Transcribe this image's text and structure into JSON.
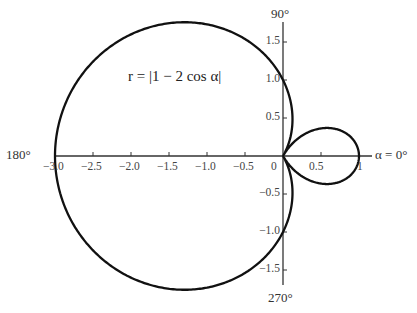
{
  "chart_data": {
    "type": "polar-line",
    "title": "",
    "equation": "r = |1 − 2 cos α|",
    "series": [
      {
        "name": "r = |1 − 2 cos α|",
        "function": "abs(1 - 2*cos(alpha))",
        "alpha_range_deg": [
          0,
          360
        ]
      }
    ],
    "angle_labels": {
      "a0": "α = 0°",
      "a90": "90°",
      "a180": "180°",
      "a270": "270°"
    },
    "x_ticks": [
      "−3.0",
      "−2.5",
      "−2.0",
      "−1.5",
      "−1.0",
      "−0.5",
      "0",
      "0.5",
      "1"
    ],
    "x_tick_values": [
      -3.0,
      -2.5,
      -2.0,
      -1.5,
      -1.0,
      -0.5,
      0,
      0.5,
      1
    ],
    "y_ticks_pos": [
      "0.5",
      "1.0",
      "1.5"
    ],
    "y_ticks_neg": [
      "−0.5",
      "−1.0",
      "−1.5"
    ],
    "y_tick_values": [
      -1.5,
      -1.0,
      -0.5,
      0.5,
      1.0,
      1.5
    ],
    "xlim": [
      -3.0,
      1.0
    ],
    "ylim": [
      -1.7,
      1.7
    ],
    "grid": false,
    "key_points": [
      {
        "alpha_deg": 0,
        "r": 1
      },
      {
        "alpha_deg": 60,
        "r": 0
      },
      {
        "alpha_deg": 90,
        "r": 1
      },
      {
        "alpha_deg": 180,
        "r": 3
      },
      {
        "alpha_deg": 270,
        "r": 1
      },
      {
        "alpha_deg": 300,
        "r": 0
      }
    ]
  }
}
